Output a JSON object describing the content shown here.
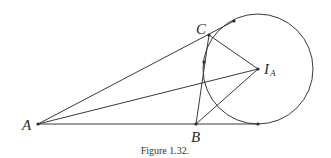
{
  "figure": {
    "caption": "Figure 1.32.",
    "colors": {
      "stroke": "#3a3a3a",
      "background": "#ffffff"
    },
    "points": {
      "A": {
        "label": "A",
        "x": 38,
        "y": 124
      },
      "B": {
        "label": "B",
        "x": 196,
        "y": 124
      },
      "C": {
        "label": "C",
        "x": 209,
        "y": 35
      },
      "IA": {
        "label": "I",
        "subscript": "A",
        "x": 258,
        "y": 69
      }
    },
    "excircle": {
      "center": "I_A",
      "cx": 258,
      "cy": 69,
      "r": 55
    },
    "tangent_points": [
      {
        "name": "on-line-AB-extended",
        "x": 258,
        "y": 124
      },
      {
        "name": "on-line-AC-extended",
        "x": 234,
        "y": 21
      },
      {
        "name": "on-segment-BC",
        "x": 204,
        "y": 62
      }
    ],
    "segments": [
      [
        "A",
        "B-extended"
      ],
      [
        "A",
        "C-extended"
      ],
      [
        "A",
        "I_A"
      ],
      [
        "B",
        "C"
      ],
      [
        "B",
        "I_A"
      ],
      [
        "C",
        "I_A"
      ]
    ]
  }
}
